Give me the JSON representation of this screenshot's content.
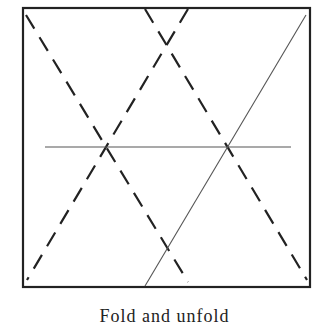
{
  "figure": {
    "frame": {
      "x": 23,
      "y": 8,
      "width": 287,
      "height": 279,
      "stroke": "#222222",
      "stroke_width": 2.2
    },
    "lines": [
      {
        "name": "dashed-line-left-descending",
        "x1": 26,
        "y1": 15,
        "x2": 188,
        "y2": 282,
        "style": "dashed",
        "stroke": "#222222",
        "width": 2.2
      },
      {
        "name": "dashed-line-center-descending",
        "x1": 145,
        "y1": 9,
        "x2": 307,
        "y2": 280,
        "style": "dashed",
        "stroke": "#222222",
        "width": 2.2
      },
      {
        "name": "dashed-line-ascending",
        "x1": 188,
        "y1": 9,
        "x2": 27,
        "y2": 280,
        "style": "dashed",
        "stroke": "#222222",
        "width": 2.2
      },
      {
        "name": "solid-line-ascending",
        "x1": 306,
        "y1": 15,
        "x2": 145,
        "y2": 286,
        "style": "solid",
        "stroke": "#555555",
        "width": 1.1
      },
      {
        "name": "horizontal-line",
        "x1": 45,
        "y1": 147,
        "x2": 291,
        "y2": 147,
        "style": "solid",
        "stroke": "#555555",
        "width": 1.1
      }
    ]
  },
  "caption": "Fold and unfold"
}
